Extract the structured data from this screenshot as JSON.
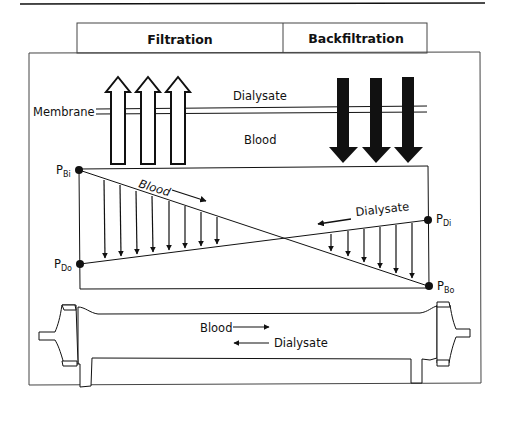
{
  "header": {
    "filtration_label": "Filtration",
    "backfiltration_label": "Backfiltration"
  },
  "top_panel": {
    "membrane_label": "Membrane",
    "dialysate_label": "Dialysate",
    "blood_label": "Blood",
    "filtration_arrow_count": 3,
    "filtration_arrow_direction": "up",
    "filtration_arrow_style": "outline",
    "backfiltration_arrow_count": 3,
    "backfiltration_arrow_direction": "down",
    "backfiltration_arrow_style": "solid"
  },
  "pressure_panel": {
    "points": [
      {
        "id": "PBi",
        "main": "P",
        "sub": "Bi",
        "position": "top-left"
      },
      {
        "id": "PDo",
        "main": "P",
        "sub": "Do",
        "position": "bottom-left"
      },
      {
        "id": "PDi",
        "main": "P",
        "sub": "Di",
        "position": "top-right"
      },
      {
        "id": "PBo",
        "main": "P",
        "sub": "Bo",
        "position": "bottom-right"
      }
    ],
    "blood_flow_label": "Blood",
    "blood_flow_direction": "right",
    "dialysate_flow_label": "Dialysate",
    "dialysate_flow_direction": "left",
    "filtration_flux_arrows": 8,
    "backfiltration_flux_arrows": 6
  },
  "dialyzer": {
    "blood_label": "Blood",
    "blood_direction": "right",
    "dialysate_label": "Dialysate",
    "dialysate_direction": "left"
  },
  "colors": {
    "line": "#111111",
    "background": "#ffffff",
    "frame": "#333333"
  }
}
